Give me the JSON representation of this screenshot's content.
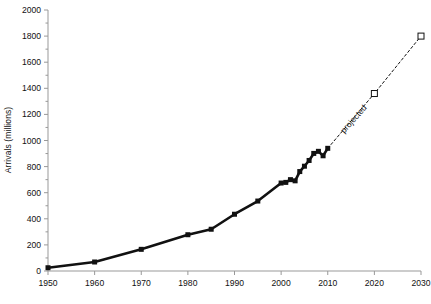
{
  "chart_data": {
    "type": "line",
    "title": "",
    "xlabel": "",
    "ylabel": "Arrivals (millions)",
    "xlim": [
      1950,
      2030
    ],
    "ylim": [
      0,
      2000
    ],
    "xticks": [
      1950,
      1960,
      1970,
      1980,
      1990,
      2000,
      2010,
      2020,
      2030
    ],
    "yticks": [
      0,
      200,
      400,
      600,
      800,
      1000,
      1200,
      1400,
      1600,
      1800,
      2000
    ],
    "xtick_labels": [
      "1950",
      "1960",
      "1970",
      "1980",
      "1990",
      "2000",
      "2010",
      "2020",
      "2030"
    ],
    "ytick_labels": [
      "0",
      "200",
      "400",
      "600",
      "800",
      "1000",
      "1200",
      "1400",
      "1600",
      "1800",
      "2000"
    ],
    "minor_y_ticks": true,
    "grid": false,
    "legend": null,
    "annotations": [
      {
        "text": "projected",
        "x": 2016,
        "y": 1150,
        "rotation": -48
      }
    ],
    "series": [
      {
        "name": "actual",
        "style": "solid",
        "marker": "filled-square",
        "color": "#111111",
        "points": [
          {
            "x": 1950,
            "y": 25
          },
          {
            "x": 1960,
            "y": 69
          },
          {
            "x": 1970,
            "y": 166
          },
          {
            "x": 1980,
            "y": 278
          },
          {
            "x": 1985,
            "y": 320
          },
          {
            "x": 1990,
            "y": 435
          },
          {
            "x": 1995,
            "y": 536
          },
          {
            "x": 2000,
            "y": 674
          },
          {
            "x": 2001,
            "y": 679
          },
          {
            "x": 2002,
            "y": 700
          },
          {
            "x": 2003,
            "y": 691
          },
          {
            "x": 2004,
            "y": 762
          },
          {
            "x": 2005,
            "y": 803
          },
          {
            "x": 2006,
            "y": 847
          },
          {
            "x": 2007,
            "y": 901
          },
          {
            "x": 2008,
            "y": 917
          },
          {
            "x": 2009,
            "y": 883
          },
          {
            "x": 2010,
            "y": 940
          }
        ]
      },
      {
        "name": "projected",
        "style": "dashed",
        "marker": "open-square",
        "color": "#111111",
        "points": [
          {
            "x": 2010,
            "y": 940
          },
          {
            "x": 2020,
            "y": 1360
          },
          {
            "x": 2030,
            "y": 1800
          }
        ]
      }
    ]
  }
}
